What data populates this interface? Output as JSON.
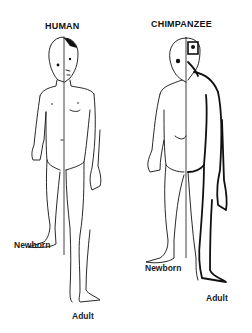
{
  "figure": {
    "panels": [
      {
        "title": "HUMAN",
        "labels": {
          "left_half": "Newborn",
          "right_half": "Adult"
        }
      },
      {
        "title": "CHIMPANZEE",
        "labels": {
          "left_half": "Newborn",
          "right_half": "Adult"
        }
      }
    ]
  },
  "colors": {
    "ink": "#111111",
    "background": "#ffffff"
  }
}
